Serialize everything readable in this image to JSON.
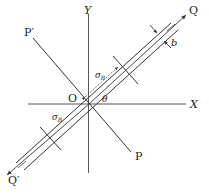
{
  "diagram": {
    "labels": {
      "y_axis": "Y",
      "x_axis": "X",
      "origin": "O",
      "p_prime": "P′",
      "p": "P",
      "q": "Q",
      "q_prime": "Q′",
      "theta": "θ",
      "sigma_b_upper": "σ",
      "sigma_b_upper_sub": "B",
      "sigma_b_lower": "σ",
      "sigma_b_lower_sub": "B",
      "band_width": "b"
    },
    "colors": {
      "stroke": "#333333",
      "text": "#222222"
    }
  }
}
